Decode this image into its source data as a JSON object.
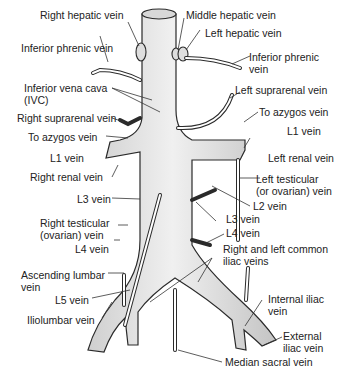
{
  "colors": {
    "vessel_fill": "#e4e4e4",
    "vessel_shadow": "#c8c8c8",
    "vessel_outline": "#2a2a2a",
    "leader_line": "#333333",
    "label_text": "#222222"
  },
  "labels": {
    "right_hepatic_vein": "Right hepatic vein",
    "middle_hepatic_vein": "Middle hepatic vein",
    "left_hepatic_vein": "Left hepatic vein",
    "inferior_phrenic_vein_right": "Inferior phrenic vein",
    "inferior_phrenic_vein_left": "Inferior phrenic\nvein",
    "ivc": "Inferior vena cava\n(IVC)",
    "right_suprarenal_vein": "Right suprarenal vein",
    "left_suprarenal_vein": "Left suprarenal vein",
    "to_azygos_right": "To azygos vein",
    "to_azygos_left": "To azygos vein",
    "l1_vein_right": "L1 vein",
    "l1_vein_left": "L1 vein",
    "right_renal_vein": "Right renal vein",
    "left_renal_vein": "Left renal vein",
    "left_testicular_vein": "Left testicular\n(or ovarian) vein",
    "l2_vein": "L2 vein",
    "l3_vein_right": "L3 vein",
    "l3_vein_left": "L3 vein",
    "right_testicular_vein": "Right testicular\n(ovarian) vein",
    "l4_vein_right": "L4 vein",
    "l4_vein_left": "L4 vein",
    "common_iliac_veins": "Right and left common\niliac veins",
    "ascending_lumbar_vein": "Ascending lumbar\nvein",
    "l5_vein": "L5 vein",
    "iliolumbar_vein": "Iliolumbar vein",
    "internal_iliac_vein": "Internal iliac\nvein",
    "external_iliac_vein": "External\niliac vein",
    "median_sacral_vein": "Median sacral vein"
  }
}
